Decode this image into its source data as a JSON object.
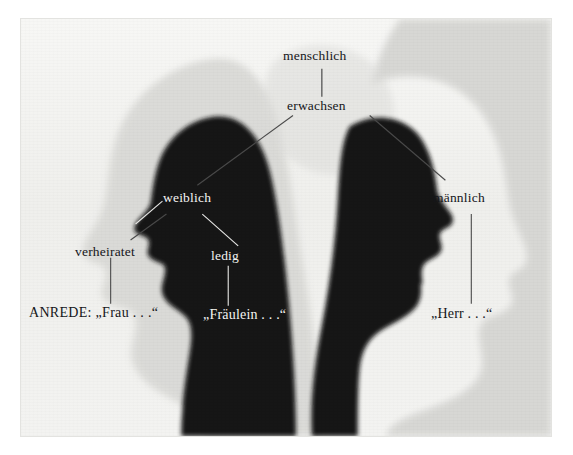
{
  "figure": {
    "background_color": "#f1f1ef",
    "silhouette_color": "#151515",
    "ghost_color": "#d0d0cd",
    "label_dark_color": "#15161a",
    "label_light_color": "#f4f4f2",
    "leader_line_dark": "#3a3a3a",
    "leader_line_light": "#e8e8e6"
  },
  "labels": {
    "menschlich": "menschlich",
    "erwachsen": "erwachsen",
    "weiblich": "weiblich",
    "maennlich": "männlich",
    "verheiratet": "verheiratet",
    "ledig": "ledig",
    "anrede_frau": "ANREDE: „Frau . . .“",
    "anrede_fraeulein": "„Fräulein . . .“",
    "anrede_herr": "„Herr . . .“"
  },
  "hierarchy": {
    "root": "menschlich",
    "level2": [
      "erwachsen"
    ],
    "level3": [
      "weiblich",
      "männlich"
    ],
    "level4": [
      "verheiratet",
      "ledig"
    ],
    "forms_of_address": [
      "ANREDE: „Frau . . .“",
      "„Fräulein . . .“",
      "„Herr . . .“"
    ]
  }
}
